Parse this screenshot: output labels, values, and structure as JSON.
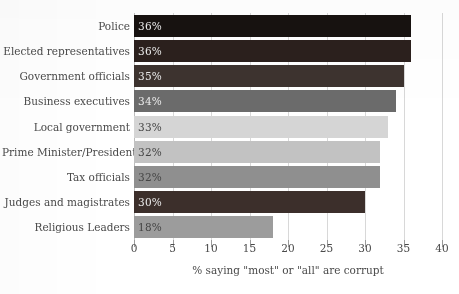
{
  "chart_data": {
    "type": "bar",
    "orientation": "horizontal",
    "title": "",
    "subtitle": "",
    "xlabel": "% saying \"most\" or \"all\" are corrupt",
    "ylabel": "",
    "categories": [
      "Police",
      "Elected representatives",
      "Government officials",
      "Business executives",
      "Local government",
      "Prime Minister/President",
      "Tax officials",
      "Judges and magistrates",
      "Religious Leaders"
    ],
    "values": [
      36,
      36,
      35,
      34,
      33,
      32,
      32,
      30,
      18
    ],
    "value_labels": [
      "36%",
      "36%",
      "35%",
      "34%",
      "33%",
      "32%",
      "32%",
      "30%",
      "18%"
    ],
    "bar_colors": [
      "#171210",
      "#2b201d",
      "#3d332f",
      "#6b6b6b",
      "#d5d5d5",
      "#c2c2c2",
      "#8f8f8f",
      "#3c2f2b",
      "#9c9c9c"
    ],
    "value_label_contrast": [
      "light",
      "light",
      "light",
      "light",
      "dark",
      "dark",
      "dark",
      "light",
      "dark"
    ],
    "xlim": [
      0,
      40
    ],
    "xticks": [
      0,
      5,
      10,
      15,
      20,
      25,
      30,
      35,
      40
    ],
    "xtick_labels": [
      "0",
      "5",
      "10",
      "15",
      "20",
      "25",
      "30",
      "35",
      "40"
    ],
    "grid": true,
    "grid_axis": "x",
    "legend": false,
    "legend_position": "none",
    "axis_color": "#bdbdbd",
    "grid_color": "#d8d8d8",
    "text_color": "#4a4a4a",
    "background_color": "#ffffff"
  }
}
